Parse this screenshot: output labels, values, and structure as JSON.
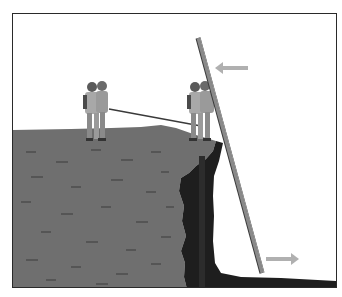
{
  "scene": {
    "description": "Firefighters raising a ladder at a cliff edge",
    "colors": {
      "background": "#ffffff",
      "frame_border": "#2a2a2a",
      "ground": "#6f6f6f",
      "ground_texture": "#555555",
      "cliff_face": "#1e1e1e",
      "cliff_shadow": "#2c2c2c",
      "ladder": "#8a8a8a",
      "ladder_outline": "#3a3a3a",
      "firefighter_coat": "#a8a8a8",
      "firefighter_dark": "#4a4a4a",
      "rope": "#3a3a3a",
      "arrow": "#b0b0b0"
    },
    "arrows": [
      {
        "name": "pull-left-arrow",
        "direction": "left",
        "icon": "arrow-left-icon"
      },
      {
        "name": "push-right-arrow",
        "direction": "right",
        "icon": "arrow-right-icon"
      }
    ],
    "figures": [
      {
        "name": "firefighter-group-left",
        "count": 2
      },
      {
        "name": "firefighter-group-right",
        "count": 2
      }
    ]
  }
}
